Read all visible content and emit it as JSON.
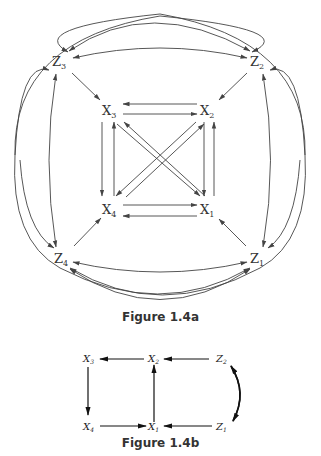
{
  "figure_a": {
    "caption": "Figure 1.4a",
    "nodes": [
      {
        "id": "Z3",
        "base": "Z",
        "sub": "3"
      },
      {
        "id": "Z2",
        "base": "Z",
        "sub": "2"
      },
      {
        "id": "X3",
        "base": "X",
        "sub": "3"
      },
      {
        "id": "X2",
        "base": "X",
        "sub": "2"
      },
      {
        "id": "X4",
        "base": "X",
        "sub": "4"
      },
      {
        "id": "X1",
        "base": "X",
        "sub": "1"
      },
      {
        "id": "Z4",
        "base": "Z",
        "sub": "4"
      },
      {
        "id": "Z1",
        "base": "Z",
        "sub": "1"
      }
    ],
    "edges": [
      "Z3->X3",
      "Z2->X2",
      "Z4->X4",
      "Z1->X1",
      "X2->X3",
      "X3->X2",
      "X4->X1",
      "X1->X4",
      "X3->X4",
      "X4->X3",
      "X2->X1",
      "X1->X2",
      "X3->X1",
      "X1->X3",
      "X2->X4",
      "X4->X2",
      "Z3<->Z2",
      "Z4<->Z1",
      "Z3<->Z4",
      "Z2<->Z1",
      "Z3<->Z1",
      "Z2<->Z4"
    ]
  },
  "figure_b": {
    "caption": "Figure 1.4b",
    "nodes": [
      {
        "id": "X3",
        "base": "X",
        "sub": "3"
      },
      {
        "id": "X2",
        "base": "X",
        "sub": "2"
      },
      {
        "id": "Z2",
        "base": "Z",
        "sub": "2"
      },
      {
        "id": "X4",
        "base": "X",
        "sub": "4"
      },
      {
        "id": "X1",
        "base": "X",
        "sub": "1"
      },
      {
        "id": "Z1",
        "base": "Z",
        "sub": "1"
      }
    ],
    "edges": [
      "X2->X3",
      "Z2->X2",
      "X3->X4",
      "X1->X2",
      "X4->X1",
      "Z1->X1",
      "Z2<->Z1"
    ]
  }
}
